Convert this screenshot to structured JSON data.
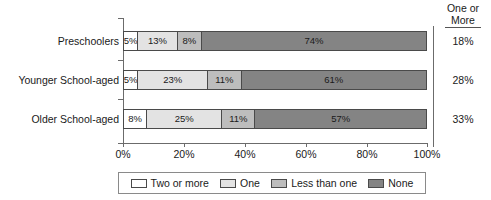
{
  "chart_data": {
    "type": "bar",
    "orientation": "horizontal",
    "stacked": true,
    "title": "",
    "xlabel": "",
    "ylabel": "",
    "xlim": [
      0,
      100
    ],
    "grid": false,
    "legend_position": "bottom",
    "categories": [
      "Preschoolers",
      "Younger School-aged",
      "Older School-aged"
    ],
    "series": [
      {
        "name": "Two or more",
        "color": "#ffffff",
        "values": [
          5,
          5,
          8
        ]
      },
      {
        "name": "One",
        "color": "#e3e3e3",
        "values": [
          13,
          23,
          25
        ]
      },
      {
        "name": "Less than one",
        "color": "#bdbdbd",
        "values": [
          8,
          11,
          11
        ]
      },
      {
        "name": "None",
        "color": "#848484",
        "values": [
          74,
          61,
          57
        ]
      }
    ],
    "value_labels": [
      [
        "5%",
        "13%",
        "8%",
        "74%"
      ],
      [
        "5%",
        "23%",
        "11%",
        "61%"
      ],
      [
        "8%",
        "25%",
        "11%",
        "57%"
      ]
    ],
    "x_ticks": [
      0,
      20,
      40,
      60,
      80,
      100
    ],
    "x_tick_labels": [
      "0%",
      "20%",
      "40%",
      "60%",
      "80%",
      "100%"
    ],
    "side_column": {
      "header_line1": "One or",
      "header_line2": "More",
      "values": [
        "18%",
        "28%",
        "33%"
      ]
    }
  },
  "legend": {
    "items": [
      {
        "label": "Two or more"
      },
      {
        "label": "One"
      },
      {
        "label": "Less than one"
      },
      {
        "label": "None"
      }
    ]
  }
}
